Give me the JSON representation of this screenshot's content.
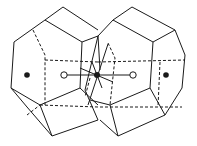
{
  "figure": {
    "colors": {
      "line": "#1a1a1a",
      "background": "#ffffff",
      "filled_atom": "#1a1a1a",
      "open_atom": "#ffffff"
    },
    "atoms": [
      {
        "type": "filled",
        "cx": 27,
        "cy": 75
      },
      {
        "type": "open",
        "cx": 64,
        "cy": 75
      },
      {
        "type": "filled-center",
        "cx": 97,
        "cy": 75
      },
      {
        "type": "open",
        "cx": 133,
        "cy": 75
      },
      {
        "type": "filled",
        "cx": 166,
        "cy": 75
      }
    ]
  }
}
